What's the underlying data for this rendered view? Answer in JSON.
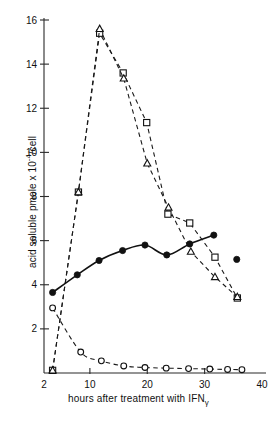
{
  "chart_data": {
    "type": "scatter",
    "title": "",
    "xlabel": "hours after treatment with IFNγ",
    "xlabel_main": "hours after treatment with IFN",
    "xlabel_sub": "γ",
    "ylabel": "acid soluble pmole x 10-4/cell",
    "ylabel_main": "acid soluble pmole x 10",
    "ylabel_sup": "-4",
    "ylabel_tail": "/cell",
    "xlim": [
      2,
      40
    ],
    "ylim": [
      0,
      16
    ],
    "xticks": [
      2,
      10,
      20,
      30,
      40
    ],
    "xtick_labels": [
      "2",
      "10",
      "20",
      "30",
      "40"
    ],
    "yticks": [
      2,
      4,
      6,
      8,
      10,
      12,
      14,
      16
    ],
    "ytick_labels": [
      "2",
      "4",
      "6",
      "8",
      "10",
      "12",
      "14",
      "16"
    ],
    "grid": false,
    "legend": "none",
    "series": [
      {
        "name": "open-square-series",
        "marker": "open-square",
        "line": "dashed",
        "points": [
          {
            "x": 3.5,
            "y": 0.12
          },
          {
            "x": 8.0,
            "y": 8.2
          },
          {
            "x": 11.7,
            "y": 15.4
          },
          {
            "x": 15.8,
            "y": 13.6
          },
          {
            "x": 19.9,
            "y": 11.35
          },
          {
            "x": 23.6,
            "y": 7.2
          },
          {
            "x": 27.4,
            "y": 6.8
          },
          {
            "x": 31.8,
            "y": 5.25
          },
          {
            "x": 35.7,
            "y": 3.4
          }
        ]
      },
      {
        "name": "open-triangle-series",
        "marker": "open-triangle",
        "line": "dashed",
        "points": [
          {
            "x": 3.5,
            "y": 0.12
          },
          {
            "x": 8.0,
            "y": 8.2
          },
          {
            "x": 11.7,
            "y": 15.6
          },
          {
            "x": 15.9,
            "y": 13.35
          },
          {
            "x": 20.0,
            "y": 9.5
          },
          {
            "x": 23.7,
            "y": 7.5
          },
          {
            "x": 27.6,
            "y": 5.5
          },
          {
            "x": 31.8,
            "y": 4.35
          },
          {
            "x": 35.7,
            "y": 3.45
          }
        ]
      },
      {
        "name": "filled-circle-series",
        "marker": "filled-circle",
        "line": "solid",
        "points": [
          {
            "x": 3.5,
            "y": 3.65
          },
          {
            "x": 7.8,
            "y": 4.45
          },
          {
            "x": 11.6,
            "y": 5.1
          },
          {
            "x": 15.7,
            "y": 5.55
          },
          {
            "x": 19.6,
            "y": 5.8
          },
          {
            "x": 23.4,
            "y": 5.35
          },
          {
            "x": 27.4,
            "y": 5.85
          },
          {
            "x": 31.6,
            "y": 6.25
          },
          {
            "x": 35.6,
            "y": 5.15
          }
        ]
      },
      {
        "name": "open-circle-series",
        "marker": "open-circle",
        "line": "dashed",
        "points": [
          {
            "x": 3.5,
            "y": 2.95
          },
          {
            "x": 8.4,
            "y": 0.95
          },
          {
            "x": 12.0,
            "y": 0.55
          },
          {
            "x": 15.9,
            "y": 0.32
          },
          {
            "x": 19.6,
            "y": 0.25
          },
          {
            "x": 23.3,
            "y": 0.22
          },
          {
            "x": 27.2,
            "y": 0.2
          },
          {
            "x": 30.9,
            "y": 0.18
          },
          {
            "x": 34.0,
            "y": 0.16
          },
          {
            "x": 36.5,
            "y": 0.15
          }
        ]
      }
    ]
  }
}
